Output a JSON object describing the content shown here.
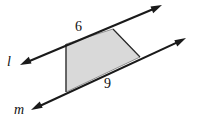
{
  "figure": {
    "background_color": "#ffffff",
    "stroke_color": "#1a1a1a",
    "shape_fill_color": "#d9d9d9",
    "shape_stroke_color": "#8f8f8f",
    "lines": [
      {
        "name": "line-l",
        "label": "l",
        "style": "double-headed arrow",
        "x1": 20,
        "y1": 65,
        "x2": 162,
        "y2": 5
      },
      {
        "name": "line-m",
        "label": "m",
        "style": "double-headed arrow",
        "x1": 31,
        "y1": 110,
        "x2": 186,
        "y2": 38
      }
    ],
    "shape": {
      "name": "shaded-trapezoid",
      "vertices": [
        {
          "x": 66,
          "y": 44
        },
        {
          "x": 113,
          "y": 29
        },
        {
          "x": 140,
          "y": 57
        },
        {
          "x": 66,
          "y": 92
        }
      ]
    },
    "measures": [
      {
        "name": "top-side",
        "value": "6",
        "side": "top"
      },
      {
        "name": "bottom-side",
        "value": "9",
        "side": "bottom"
      }
    ]
  }
}
